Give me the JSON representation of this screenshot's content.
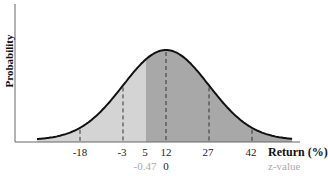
{
  "chart_data": {
    "type": "area",
    "title": "",
    "ylabel": "Probability",
    "xlabel": "Return (%)",
    "secondary_xlabel": "z-value",
    "distribution": "normal",
    "mean": 12,
    "std_dev": 15,
    "x_ticks": [
      -18,
      -3,
      5,
      12,
      27,
      42
    ],
    "z_ticks": [
      {
        "x": 5,
        "label": "-0.47"
      },
      {
        "x": 12,
        "label": "0"
      }
    ],
    "dashed_lines_at": [
      -18,
      -3,
      12,
      27,
      42
    ],
    "shaded_regions": [
      {
        "from": "left tail",
        "to": 5,
        "color": "#d4d4d4",
        "label": "return below 5%"
      },
      {
        "from": 5,
        "to": "right tail",
        "color": "#a8a8a8",
        "label": "return above 5%"
      }
    ],
    "grid": false,
    "legend": "none"
  },
  "labels": {
    "ylabel": "Probability",
    "xlabel": "Return (%)",
    "zlabel": "z-value",
    "ticks": [
      "-18",
      "-3",
      "5",
      "12",
      "27",
      "42"
    ],
    "z_ticks": [
      "-0.47",
      "0"
    ]
  },
  "colors": {
    "light_fill": "#d4d4d4",
    "dark_fill": "#a8a8a8",
    "curve": "#111111",
    "axis": "#555555"
  }
}
